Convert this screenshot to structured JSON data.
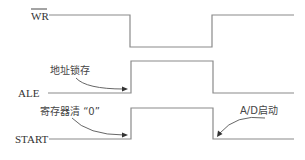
{
  "diagram": {
    "type": "timing-diagram",
    "colors": {
      "waveform": "#8a8a8a",
      "text": "#333333",
      "annotation_arrow": "#555555"
    },
    "signals": [
      {
        "name": "WR",
        "overline": true,
        "pattern": "high-low-high",
        "edges": [
          "falling",
          "rising"
        ]
      },
      {
        "name": "ALE",
        "overline": false,
        "pattern": "low-high-low",
        "edges": [
          "rising",
          "falling"
        ]
      },
      {
        "name": "START",
        "overline": false,
        "pattern": "low-high-low",
        "edges": [
          "rising",
          "falling"
        ]
      }
    ],
    "annotations": [
      {
        "text": "地址锁存",
        "target_signal": "ALE",
        "target_edge": "rising"
      },
      {
        "text": "寄存器清 “0”",
        "target_signal": "START",
        "target_edge": "rising"
      },
      {
        "text": "A/D启动",
        "target_signal": "START",
        "target_edge": "falling"
      }
    ]
  }
}
